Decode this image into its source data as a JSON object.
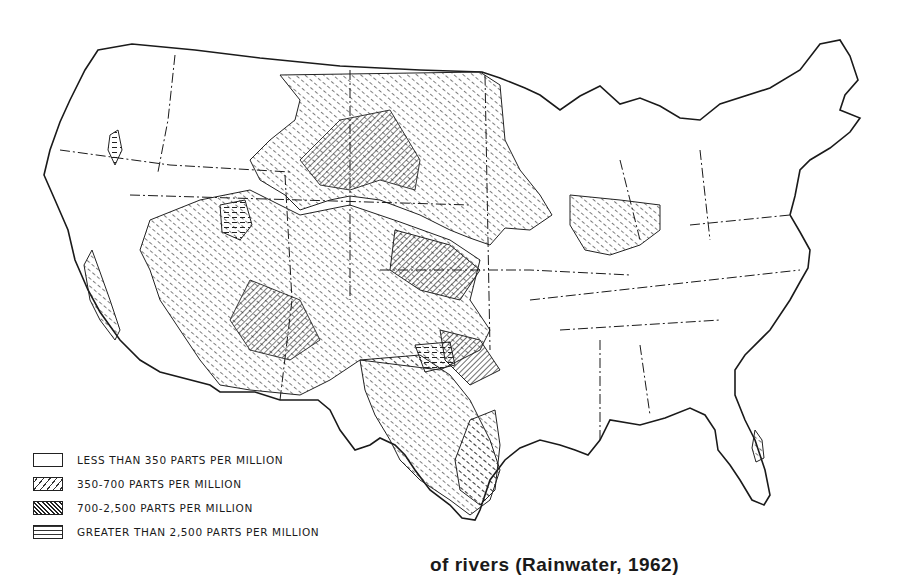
{
  "figure": {
    "type": "thematic map",
    "legend": [
      {
        "pattern": "blank",
        "label": "LESS THAN 350 PARTS PER MILLION"
      },
      {
        "pattern": "light-diagonal-hatch",
        "label": "350-700 PARTS PER MILLION"
      },
      {
        "pattern": "dense-diagonal-hatch",
        "label": "700-2,500 PARTS PER MILLION"
      },
      {
        "pattern": "horizontal-dashes",
        "label": "GREATER THAN 2,500 PARTS PER MILLION"
      }
    ],
    "caption": "of rivers (Rainwater, 1962)",
    "colors": {
      "ink": "#1a1a1a",
      "paper": "#ffffff"
    }
  }
}
